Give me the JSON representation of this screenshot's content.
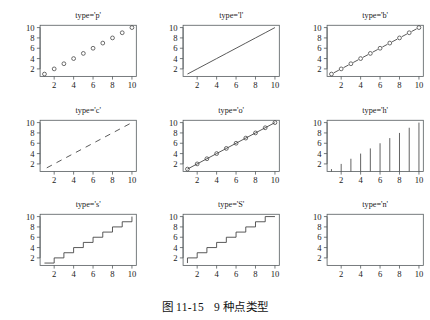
{
  "figure": {
    "caption_number": "图 11-15",
    "caption_text": "9 种点类型"
  },
  "axes": {
    "x_ticks": [
      "2",
      "4",
      "6",
      "8",
      "10"
    ],
    "y_ticks": [
      "2",
      "4",
      "6",
      "8",
      "10"
    ],
    "xlim": [
      0.55,
      10.45
    ],
    "ylim": [
      0.55,
      10.45
    ]
  },
  "panels": [
    {
      "title": "type='p'",
      "type_code": "p",
      "style": "points"
    },
    {
      "title": "type='l'",
      "type_code": "l",
      "style": "line"
    },
    {
      "title": "type='b'",
      "type_code": "b",
      "style": "both"
    },
    {
      "title": "type='c'",
      "type_code": "c",
      "style": "line-gaps"
    },
    {
      "title": "type='o'",
      "type_code": "o",
      "style": "overplot"
    },
    {
      "title": "type='h'",
      "type_code": "h",
      "style": "histogram"
    },
    {
      "title": "type='s'",
      "type_code": "s",
      "style": "step-h"
    },
    {
      "title": "type='S'",
      "type_code": "S",
      "style": "step-v"
    },
    {
      "title": "type='n'",
      "type_code": "n",
      "style": "none"
    }
  ],
  "chart_data": {
    "type": "line",
    "title": "9 种点类型",
    "subtitle": "图 11-15",
    "xlabel": "",
    "ylabel": "",
    "xlim": [
      0.55,
      10.45
    ],
    "ylim": [
      0.55,
      10.45
    ],
    "xticks": [
      2,
      4,
      6,
      8,
      10
    ],
    "yticks": [
      2,
      4,
      6,
      8,
      10
    ],
    "grid": false,
    "legend": "none",
    "x": [
      1,
      2,
      3,
      4,
      5,
      6,
      7,
      8,
      9,
      10
    ],
    "series": [
      {
        "name": "type='p'",
        "values": [
          1,
          2,
          3,
          4,
          5,
          6,
          7,
          8,
          9,
          10
        ],
        "render": "points only"
      },
      {
        "name": "type='l'",
        "values": [
          1,
          2,
          3,
          4,
          5,
          6,
          7,
          8,
          9,
          10
        ],
        "render": "line only"
      },
      {
        "name": "type='b'",
        "values": [
          1,
          2,
          3,
          4,
          5,
          6,
          7,
          8,
          9,
          10
        ],
        "render": "points and broken line"
      },
      {
        "name": "type='c'",
        "values": [
          1,
          2,
          3,
          4,
          5,
          6,
          7,
          8,
          9,
          10
        ],
        "render": "broken line with gaps, no points"
      },
      {
        "name": "type='o'",
        "values": [
          1,
          2,
          3,
          4,
          5,
          6,
          7,
          8,
          9,
          10
        ],
        "render": "points overplotted on line"
      },
      {
        "name": "type='h'",
        "values": [
          1,
          2,
          3,
          4,
          5,
          6,
          7,
          8,
          9,
          10
        ],
        "render": "vertical histogram spikes to baseline"
      },
      {
        "name": "type='s'",
        "values": [
          1,
          2,
          3,
          4,
          5,
          6,
          7,
          8,
          9,
          10
        ],
        "render": "stairs, horizontal first"
      },
      {
        "name": "type='S'",
        "values": [
          1,
          2,
          3,
          4,
          5,
          6,
          7,
          8,
          9,
          10
        ],
        "render": "stairs, vertical first"
      },
      {
        "name": "type='n'",
        "values": [
          1,
          2,
          3,
          4,
          5,
          6,
          7,
          8,
          9,
          10
        ],
        "render": "nothing plotted"
      }
    ]
  }
}
